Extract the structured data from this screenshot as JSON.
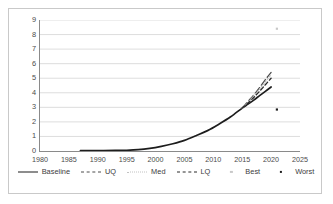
{
  "chart_data": {
    "type": "line",
    "title": "",
    "xlabel": "",
    "ylabel": "",
    "xlim": [
      1980,
      2025
    ],
    "ylim": [
      0,
      9
    ],
    "xticks": [
      1980,
      1985,
      1990,
      1995,
      2000,
      2005,
      2010,
      2015,
      2020,
      2025
    ],
    "yticks": [
      0,
      1,
      2,
      3,
      4,
      5,
      6,
      7,
      8,
      9
    ],
    "grid": "horizontal",
    "legend_position": "bottom",
    "series": [
      {
        "name": "Baseline",
        "style": "solid",
        "color": "#1d1d1d",
        "x": [
          1987,
          1990,
          1993,
          1995,
          1997,
          1999,
          2001,
          2003,
          2005,
          2007,
          2009,
          2011,
          2013,
          2015,
          2016,
          2017,
          2018,
          2019,
          2020
        ],
        "values": [
          0.02,
          0.03,
          0.04,
          0.05,
          0.09,
          0.18,
          0.32,
          0.5,
          0.73,
          1.05,
          1.4,
          1.85,
          2.35,
          2.95,
          3.22,
          3.5,
          3.8,
          4.1,
          4.4
        ]
      },
      {
        "name": "UQ",
        "style": "long-dash",
        "color": "#4d4d4d",
        "x": [
          2015,
          2016,
          2017,
          2018,
          2019,
          2020
        ],
        "values": [
          2.95,
          3.4,
          3.85,
          4.35,
          4.9,
          5.4
        ]
      },
      {
        "name": "Med",
        "style": "dotted",
        "color": "#c2c2c2",
        "x": [
          2015,
          2016,
          2017,
          2018,
          2019,
          2020
        ],
        "values": [
          2.95,
          3.35,
          3.78,
          4.25,
          4.75,
          5.25
        ]
      },
      {
        "name": "LQ",
        "style": "dash",
        "color": "#2b2b2b",
        "x": [
          2015,
          2016,
          2017,
          2018,
          2019,
          2020
        ],
        "values": [
          2.95,
          3.3,
          3.68,
          4.1,
          4.55,
          5.0
        ]
      },
      {
        "name": "Best",
        "style": "marker",
        "color": "#c8c8c8",
        "x": [
          2021
        ],
        "values": [
          8.4
        ]
      },
      {
        "name": "Worst",
        "style": "marker",
        "color": "#1d1d1d",
        "x": [
          2021
        ],
        "values": [
          2.85
        ]
      }
    ],
    "legend": [
      {
        "label": "Baseline",
        "style": "solid",
        "color": "#1d1d1d"
      },
      {
        "label": "UQ",
        "style": "long-dash",
        "color": "#4d4d4d"
      },
      {
        "label": "Med",
        "style": "dotted",
        "color": "#c2c2c2"
      },
      {
        "label": "LQ",
        "style": "dash",
        "color": "#2b2b2b"
      },
      {
        "label": "Best",
        "style": "marker",
        "color": "#c8c8c8"
      },
      {
        "label": "Worst",
        "style": "marker",
        "color": "#1d1d1d"
      }
    ]
  },
  "colors": {
    "grid": "#d4d4d4",
    "axis": "#8a8a8a",
    "frame": "#c9c9c9",
    "text": "#4a4a4a",
    "background": "#ffffff"
  }
}
